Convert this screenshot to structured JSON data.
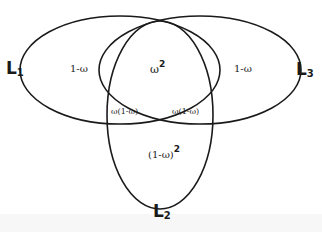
{
  "diagram": {
    "type": "venn-three-loci",
    "sets": [
      {
        "id": "L1",
        "letter": "L",
        "subscript": "1",
        "position": "left"
      },
      {
        "id": "L2",
        "letter": "L",
        "subscript": "2",
        "position": "bottom"
      },
      {
        "id": "L3",
        "letter": "L",
        "subscript": "3",
        "position": "right"
      }
    ],
    "regions": {
      "l1_only": "1-ω",
      "l3_only": "1-ω",
      "l1_l3_overlap": {
        "base": "ω",
        "exponent": "2"
      },
      "l1_l2_overlap": "ω(1-ω)",
      "l3_l2_overlap": "ω(1-ω)",
      "l2_only": {
        "base": "(1-ω)",
        "exponent": "2"
      }
    },
    "stroke_color": "#1a1a1a",
    "background": "#ffffff"
  }
}
